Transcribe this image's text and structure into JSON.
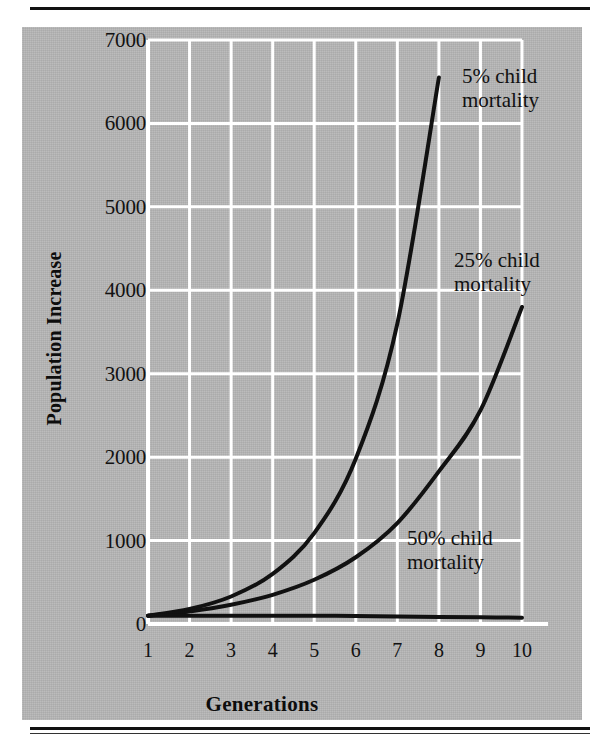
{
  "figure": {
    "background_color": "#b6b6b6",
    "gridline_color": "#ffffff",
    "line_color": "#111111"
  },
  "chart_data": {
    "type": "line",
    "title": "",
    "xlabel": "Generations",
    "ylabel": "Population Increase",
    "xlim": [
      1,
      10
    ],
    "ylim": [
      0,
      7000
    ],
    "grid": true,
    "legend_position": "inline-annotations",
    "x_tick_labels": [
      "1",
      "2",
      "3",
      "4",
      "5",
      "6",
      "7",
      "8",
      "9",
      "10"
    ],
    "y_tick_labels": [
      "0",
      "1000",
      "2000",
      "3000",
      "4000",
      "5000",
      "6000",
      "7000"
    ],
    "x": [
      1,
      2,
      3,
      4,
      5,
      6,
      7,
      8,
      9,
      10
    ],
    "series": [
      {
        "name": "5% child mortality",
        "label": "5% child\nmortality",
        "values": [
          100,
          180,
          330,
          600,
          1090,
          1980,
          3600,
          6550,
          null,
          null
        ]
      },
      {
        "name": "25% child mortality",
        "label": "25% child\nmortality",
        "values": [
          100,
          150,
          230,
          350,
          530,
          800,
          1210,
          1830,
          2560,
          3800
        ]
      },
      {
        "name": "50% child mortality",
        "label": "50% child\nmortality",
        "values": [
          100,
          100,
          100,
          100,
          100,
          95,
          90,
          85,
          80,
          75
        ]
      }
    ]
  },
  "axis": {
    "y_ticks": [
      {
        "label": "7000",
        "value": 7000
      },
      {
        "label": "6000",
        "value": 6000
      },
      {
        "label": "5000",
        "value": 5000
      },
      {
        "label": "4000",
        "value": 4000
      },
      {
        "label": "3000",
        "value": 3000
      },
      {
        "label": "2000",
        "value": 2000
      },
      {
        "label": "1000",
        "value": 1000
      },
      {
        "label": "0",
        "value": 0
      }
    ],
    "x_ticks": [
      {
        "label": "1",
        "value": 1
      },
      {
        "label": "2",
        "value": 2
      },
      {
        "label": "3",
        "value": 3
      },
      {
        "label": "4",
        "value": 4
      },
      {
        "label": "5",
        "value": 5
      },
      {
        "label": "6",
        "value": 6
      },
      {
        "label": "7",
        "value": 7
      },
      {
        "label": "8",
        "value": 8
      },
      {
        "label": "9",
        "value": 9
      },
      {
        "label": "10",
        "value": 10
      }
    ],
    "x_title": "Generations",
    "y_title": "Population Increase"
  },
  "annotations": {
    "series_5": "5% child\nmortality",
    "series_25": "25% child\nmortality",
    "series_50": "50% child\nmortality"
  }
}
